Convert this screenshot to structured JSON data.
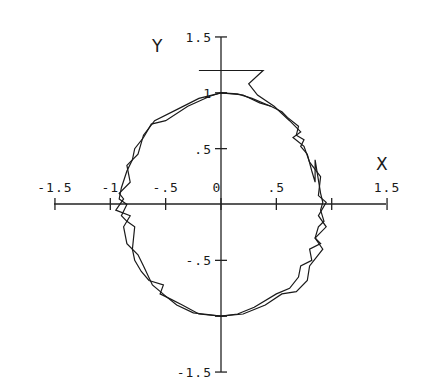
{
  "chart_data": {
    "type": "line",
    "title": "",
    "xlabel": "X",
    "ylabel": "Y",
    "xlim": [
      -1.5,
      1.5
    ],
    "ylim": [
      -1.5,
      1.5
    ],
    "grid": false,
    "legend": null,
    "x_ticks": [
      -1.5,
      -1,
      -0.5,
      0,
      0.5,
      1.5
    ],
    "x_tick_labels": [
      "-1.5",
      "-1",
      "-.5",
      "0",
      ".5",
      "1.5"
    ],
    "y_ticks": [
      1.5,
      1,
      0.5,
      -0.5,
      -1.5
    ],
    "y_tick_labels": [
      "1.5",
      "1",
      ".5",
      "-.5",
      "-1.5"
    ],
    "series": [
      {
        "name": "trajectory-1",
        "points": [
          [
            0.0,
            1.0
          ],
          [
            0.2,
            0.98
          ],
          [
            0.35,
            0.91
          ],
          [
            0.45,
            0.88
          ],
          [
            0.55,
            0.83
          ],
          [
            0.6,
            0.78
          ],
          [
            0.7,
            0.7
          ],
          [
            0.68,
            0.62
          ],
          [
            0.75,
            0.58
          ],
          [
            0.72,
            0.52
          ],
          [
            0.78,
            0.45
          ],
          [
            0.82,
            0.3
          ],
          [
            0.85,
            0.2
          ],
          [
            0.85,
            0.4
          ],
          [
            0.9,
            0.1
          ],
          [
            0.92,
            0.02
          ],
          [
            0.9,
            -0.05
          ],
          [
            0.93,
            -0.15
          ],
          [
            0.88,
            -0.2
          ],
          [
            0.85,
            -0.3
          ],
          [
            0.9,
            -0.35
          ],
          [
            0.8,
            -0.4
          ],
          [
            0.82,
            -0.5
          ],
          [
            0.72,
            -0.55
          ],
          [
            0.7,
            -0.65
          ],
          [
            0.62,
            -0.75
          ],
          [
            0.5,
            -0.8
          ],
          [
            0.3,
            -0.92
          ],
          [
            0.15,
            -0.98
          ],
          [
            0.0,
            -1.0
          ],
          [
            -0.2,
            -0.98
          ],
          [
            -0.35,
            -0.9
          ],
          [
            -0.45,
            -0.85
          ],
          [
            -0.55,
            -0.8
          ],
          [
            -0.52,
            -0.72
          ],
          [
            -0.65,
            -0.68
          ],
          [
            -0.72,
            -0.6
          ],
          [
            -0.78,
            -0.5
          ],
          [
            -0.8,
            -0.4
          ],
          [
            -0.78,
            -0.2
          ],
          [
            -0.85,
            -0.15
          ],
          [
            -0.9,
            -0.1
          ],
          [
            -0.85,
            0.0
          ],
          [
            -0.92,
            0.05
          ],
          [
            -0.9,
            0.15
          ],
          [
            -0.85,
            0.3
          ],
          [
            -0.8,
            0.4
          ],
          [
            -0.78,
            0.5
          ],
          [
            -0.7,
            0.6
          ],
          [
            -0.63,
            0.72
          ],
          [
            -0.5,
            0.75
          ],
          [
            -0.3,
            0.88
          ],
          [
            -0.1,
            0.97
          ],
          [
            0.0,
            1.0
          ]
        ]
      },
      {
        "name": "trajectory-2",
        "points": [
          [
            -0.2,
            1.2
          ],
          [
            0.38,
            1.2
          ],
          [
            0.25,
            1.08
          ],
          [
            0.33,
            0.98
          ],
          [
            0.48,
            0.88
          ],
          [
            0.62,
            0.75
          ],
          [
            0.72,
            0.65
          ],
          [
            0.65,
            0.6
          ],
          [
            0.75,
            0.52
          ],
          [
            0.8,
            0.38
          ],
          [
            0.9,
            0.25
          ],
          [
            0.88,
            0.08
          ],
          [
            0.95,
            0.02
          ],
          [
            0.88,
            -0.1
          ],
          [
            0.95,
            -0.2
          ],
          [
            0.85,
            -0.3
          ],
          [
            0.92,
            -0.4
          ],
          [
            0.8,
            -0.55
          ],
          [
            0.78,
            -0.68
          ],
          [
            0.68,
            -0.78
          ],
          [
            0.55,
            -0.8
          ],
          [
            0.4,
            -0.9
          ],
          [
            0.2,
            -0.98
          ],
          [
            0.0,
            -1.0
          ],
          [
            -0.25,
            -0.97
          ],
          [
            -0.4,
            -0.9
          ],
          [
            -0.5,
            -0.82
          ],
          [
            -0.62,
            -0.72
          ],
          [
            -0.7,
            -0.55
          ],
          [
            -0.75,
            -0.45
          ],
          [
            -0.85,
            -0.35
          ],
          [
            -0.88,
            -0.2
          ],
          [
            -0.82,
            -0.1
          ],
          [
            -0.95,
            -0.05
          ],
          [
            -0.88,
            0.05
          ],
          [
            -0.92,
            0.1
          ],
          [
            -0.82,
            0.2
          ],
          [
            -0.85,
            0.35
          ],
          [
            -0.75,
            0.45
          ],
          [
            -0.7,
            0.62
          ],
          [
            -0.6,
            0.75
          ],
          [
            -0.4,
            0.85
          ],
          [
            -0.2,
            0.95
          ],
          [
            0.0,
            1.0
          ],
          [
            0.15,
            0.99
          ],
          [
            0.28,
            0.95
          ],
          [
            0.45,
            0.88
          ]
        ]
      }
    ]
  }
}
